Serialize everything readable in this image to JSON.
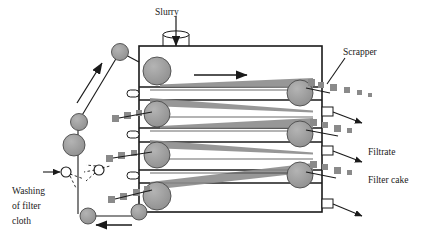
{
  "diagram": {
    "type": "process-equipment-schematic",
    "canvas": {
      "width": 436,
      "height": 240,
      "background": "#ffffff"
    },
    "colors": {
      "outline": "#1a1a1a",
      "roller_fill": "#9a9a9a",
      "roller_stroke": "#404040",
      "cake_fill": "#8e8e8e",
      "cake_dash": "#8a8a8a",
      "belt_line": "#1a1a1a",
      "nozzle_fill": "#ffffff",
      "text": "#1a1a1a"
    },
    "labels": {
      "slurry": "Slurry",
      "scrapper": "Scrapper",
      "filtrate": "Filtrate",
      "filter_cake": "Filter cake",
      "washing_line1": "Washing",
      "washing_line2": "of filter",
      "washing_line3": "cloth"
    },
    "components": {
      "slurry_inlet": {
        "name": "slurry-inlet-cylinder",
        "x": 163,
        "y": 33,
        "width": 26,
        "height": 19
      },
      "housing": {
        "x": 139,
        "y": 46,
        "width": 183,
        "height": 166
      },
      "belt_passes": 4,
      "pass_directions": [
        "right",
        "left",
        "right",
        "left"
      ],
      "rollers_count": 12,
      "filtrate_nozzles": 5,
      "scrappers": 3,
      "wash_nozzles": 2,
      "flow_arrows": [
        "top-belt-right",
        "diagonal-up-left",
        "bottom-return-left"
      ]
    }
  }
}
